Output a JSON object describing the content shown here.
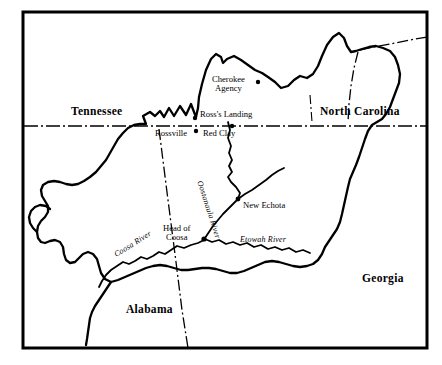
{
  "map": {
    "title": "Cherokee Nation map",
    "frame_color": "#000000",
    "background_color": "#ffffff",
    "line_color": "#000000",
    "states": [
      {
        "name": "Tennessee",
        "x": 71,
        "y": 105
      },
      {
        "name": "North Carolina",
        "x": 320,
        "y": 105
      },
      {
        "name": "Georgia",
        "x": 362,
        "y": 272
      },
      {
        "name": "Alabama",
        "x": 126,
        "y": 303
      }
    ],
    "places": [
      {
        "name": "Cherokee Agency",
        "line1": "Cherokee",
        "line2": "Agency",
        "x": 212,
        "y": 75,
        "dot_x": 258,
        "dot_y": 82
      },
      {
        "name": "Ross's Landing",
        "line1": "Ross's Landing",
        "line2": "",
        "x": 200,
        "y": 110,
        "dot_x": 195,
        "dot_y": 118
      },
      {
        "name": "Red Clay",
        "line1": "Red Clay",
        "line2": "",
        "x": 203,
        "y": 129,
        "dot_x": 232,
        "dot_y": 126
      },
      {
        "name": "Rossville",
        "line1": "Rossville",
        "line2": "",
        "x": 155,
        "y": 129,
        "dot_x": 196,
        "dot_y": 131
      },
      {
        "name": "New Echota",
        "line1": "New Echota",
        "line2": "",
        "x": 243,
        "y": 201,
        "dot_x": 238,
        "dot_y": 199
      },
      {
        "name": "Head of Coosa",
        "line1": "Head of",
        "line2": "Coosa",
        "x": 163,
        "y": 224,
        "dot_x": 204,
        "dot_y": 239
      }
    ],
    "rivers": [
      {
        "name": "Oostanaula River",
        "label": "Oostanaula River",
        "x": 203,
        "y": 180
      },
      {
        "name": "Etowah River",
        "label": "Etowah River",
        "x": 240,
        "y": 241
      },
      {
        "name": "Coosa River",
        "label": "Coosa River",
        "x": 113,
        "y": 252
      }
    ]
  }
}
